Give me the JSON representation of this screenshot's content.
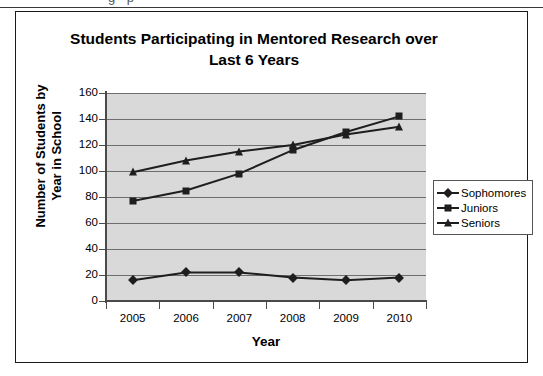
{
  "scan": {
    "top_sliver_text": "g p"
  },
  "chart_data": {
    "type": "line",
    "title": "Students Participating in Mentored Research over Last 6 Years",
    "title_lines": [
      "Students Participating in Mentored Research over",
      "Last 6 Years"
    ],
    "xlabel": "Year",
    "ylabel": "Number of Students by Year in School",
    "ylabel_lines": [
      "Number of Students by",
      "Year in School"
    ],
    "categories": [
      "2005",
      "2006",
      "2007",
      "2008",
      "2009",
      "2010"
    ],
    "series": [
      {
        "name": "Sophomores",
        "marker": "diamond",
        "values": [
          16,
          22,
          22,
          18,
          16,
          18
        ]
      },
      {
        "name": "Juniors",
        "marker": "square",
        "values": [
          77,
          85,
          98,
          116,
          130,
          142
        ]
      },
      {
        "name": "Seniors",
        "marker": "triangle",
        "values": [
          99,
          108,
          115,
          120,
          128,
          134
        ]
      }
    ],
    "ylim": [
      0,
      160
    ],
    "yticks": [
      0,
      20,
      40,
      60,
      80,
      100,
      120,
      140,
      160
    ],
    "ytick_labels": [
      "0",
      "20",
      "40",
      "60",
      "80",
      "100",
      "120",
      "140",
      "160"
    ],
    "grid": true,
    "legend_position": "right",
    "colors": {
      "line": "#1e1e1e",
      "plot_background": "#d9d9d9",
      "gridline": "#6e6e6e",
      "axis": "#4a4a4a",
      "frame": "#1a1a1a",
      "text": "#000000"
    }
  }
}
